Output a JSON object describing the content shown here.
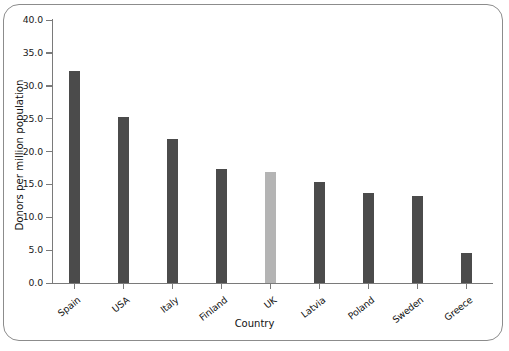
{
  "chart_data": {
    "type": "bar",
    "title": "",
    "xlabel": "Country",
    "ylabel": "Donors per million population",
    "categories": [
      "Spain",
      "USA",
      "Italy",
      "Finland",
      "UK",
      "Latvia",
      "Poland",
      "Sweden",
      "Greece"
    ],
    "values": [
      32.2,
      25.2,
      21.9,
      17.4,
      16.9,
      15.4,
      13.7,
      13.2,
      4.6
    ],
    "ylim": [
      0.0,
      40.0
    ],
    "ytick_labels": [
      "0.0",
      "5.0",
      "10.0",
      "15.0",
      "20.0",
      "25.0",
      "30.0",
      "35.0",
      "40.0"
    ],
    "ytick_values": [
      0.0,
      5.0,
      10.0,
      15.0,
      20.0,
      25.0,
      30.0,
      35.0,
      40.0
    ],
    "grid": false,
    "legend": "none",
    "bar_colors": [
      "#4b4b4b",
      "#4b4b4b",
      "#4b4b4b",
      "#4b4b4b",
      "#b4b4b4",
      "#4b4b4b",
      "#4b4b4b",
      "#4b4b4b",
      "#4b4b4b"
    ],
    "highlight_category": "UK",
    "colors": {
      "bar_default": "#4b4b4b",
      "bar_highlight": "#b4b4b4",
      "axis": "#7a7a7a",
      "frame": "#8c8c8c",
      "text": "#111111",
      "background": "#ffffff"
    }
  }
}
